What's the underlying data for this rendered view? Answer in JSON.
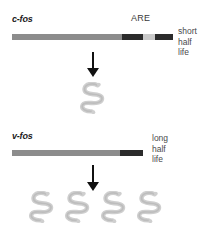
{
  "figure": {
    "background_color": "#ffffff",
    "width": 214,
    "height": 227
  },
  "colors": {
    "transcript_body": "#8c8c8c",
    "coding_dark": "#2b2b2b",
    "are_light": "#c9c9c9",
    "protein_fill": "#cfcfcf",
    "protein_stroke": "#bdbdbd",
    "arrow": "#111111",
    "text_dark": "#1a1a1a",
    "text_gray": "#4a4a4a"
  },
  "panels": [
    {
      "id": "c-fos",
      "gene_label": "c-fos",
      "element_label": "ARE",
      "half_life_lines": [
        "short",
        "half",
        "life"
      ],
      "half_life_text": "short half life",
      "protein_count": 1,
      "segments": [
        {
          "name": "utr-body",
          "color": "#8c8c8c",
          "width_px": 110
        },
        {
          "name": "coding-dark-1",
          "color": "#2b2b2b",
          "width_px": 21
        },
        {
          "name": "are-element",
          "color": "#c9c9c9",
          "width_px": 12
        },
        {
          "name": "coding-dark-2",
          "color": "#2b2b2b",
          "width_px": 18
        }
      ]
    },
    {
      "id": "v-fos",
      "gene_label": "v-fos",
      "element_label": "",
      "half_life_lines": [
        "long",
        "half",
        "life"
      ],
      "half_life_text": "long half life",
      "protein_count": 4,
      "segments": [
        {
          "name": "utr-body",
          "color": "#8c8c8c",
          "width_px": 108
        },
        {
          "name": "coding-dark-1",
          "color": "#2b2b2b",
          "width_px": 23
        }
      ]
    }
  ],
  "arrows": [
    {
      "name": "transcription-arrow-cfos",
      "direction": "down"
    },
    {
      "name": "transcription-arrow-vfos",
      "direction": "down"
    }
  ],
  "icons": {
    "protein": "protein-squiggle-icon",
    "arrow": "down-arrow-icon"
  }
}
